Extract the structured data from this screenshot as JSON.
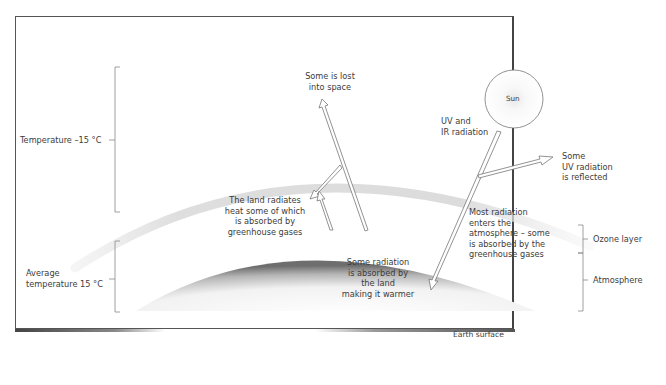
{
  "diagram": {
    "left_scale": {
      "upper_bracket_label": "Temperature –15 °C",
      "lower_bracket_label_line1": "Average",
      "lower_bracket_label_line2": "temperature 15 °C"
    },
    "right_scale": {
      "ozone_label": "Ozone layer",
      "atmosphere_label": "Atmosphere"
    },
    "sun": {
      "label": "Sun"
    },
    "annotations": {
      "lost_space_line1": "Some is lost",
      "lost_space_line2": "into space",
      "uv_ir_line1": "UV and",
      "uv_ir_line2": "IR radiation",
      "reflected_line1": "Some",
      "reflected_line2": "UV radiation",
      "reflected_line3": "is reflected",
      "land_radiates_line1": "The land radiates",
      "land_radiates_line2": "heat some of which",
      "land_radiates_line3": "is absorbed by",
      "land_radiates_line4": "greenhouse gases",
      "most_radiation_line1": "Most radiation",
      "most_radiation_line2": "enters the",
      "most_radiation_line3": "atmosphere – some",
      "most_radiation_line4": "is absorbed by the",
      "most_radiation_line5": "greenhouse gases",
      "absorbed_land_line1": "Some radiation",
      "absorbed_land_line2": "is absorbed by",
      "absorbed_land_line3": "the land",
      "absorbed_land_line4": "making it warmer",
      "earth_surface": "Earth surface"
    },
    "colors": {
      "ozone_band": "#dcdcdc",
      "earth_dark": "#7a7a7a",
      "earth_light": "#ffffff",
      "border": "#555555"
    }
  }
}
